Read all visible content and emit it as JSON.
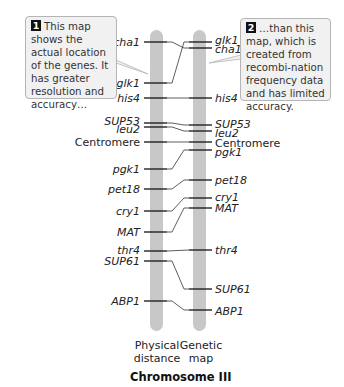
{
  "callouts": [
    {
      "number": "1",
      "text": "This map shows the actual location of the genes. It has greater resolution and accuracy…"
    },
    {
      "number": "2",
      "text": "…than this map, which is created from recombi-nation frequency data and has limited accuracy."
    }
  ],
  "maps": {
    "physical": {
      "label_line1": "Physical",
      "label_line2": "distance"
    },
    "genetic": {
      "label_line1": "Genetic",
      "label_line2": "map"
    }
  },
  "title": "Chromosome III",
  "colors": {
    "bar": "#c8c8c8",
    "callout_bg": "#f1f1f1",
    "callout_border": "#b5b5b5",
    "tick": "#111111"
  },
  "chart_data": {
    "type": "diagram",
    "title": "Chromosome III",
    "left_map": "Physical distance",
    "right_map": "Genetic map",
    "markers": [
      {
        "name": "cha1",
        "physical_y": 42,
        "genetic_y": 48
      },
      {
        "name": "glk1",
        "physical_y": 83,
        "genetic_y": 42
      },
      {
        "name": "his4",
        "physical_y": 98,
        "genetic_y": 98
      },
      {
        "name": "SUP53",
        "physical_y": 123,
        "genetic_y": 125
      },
      {
        "name": "leu2",
        "physical_y": 127,
        "genetic_y": 131
      },
      {
        "name": "Centromere",
        "physical_y": 142,
        "genetic_y": 142
      },
      {
        "name": "pgk1",
        "physical_y": 169,
        "genetic_y": 150
      },
      {
        "name": "pet18",
        "physical_y": 189,
        "genetic_y": 180
      },
      {
        "name": "cry1",
        "physical_y": 211,
        "genetic_y": 198
      },
      {
        "name": "MAT",
        "physical_y": 232,
        "genetic_y": 208
      },
      {
        "name": "thr4",
        "physical_y": 251,
        "genetic_y": 250
      },
      {
        "name": "SUP61",
        "physical_y": 261,
        "genetic_y": 289
      },
      {
        "name": "ABP1",
        "physical_y": 301,
        "genetic_y": 310
      }
    ]
  },
  "left_labels": [
    {
      "text": "cha1",
      "y": 42,
      "italic": true
    },
    {
      "text": "glk1",
      "y": 83,
      "italic": true
    },
    {
      "text": "his4",
      "y": 98,
      "italic": true
    },
    {
      "text": "SUP53",
      "y": 121,
      "italic": true
    },
    {
      "text": "leu2",
      "y": 129,
      "italic": true
    },
    {
      "text": "Centromere",
      "y": 142,
      "italic": false
    },
    {
      "text": "pgk1",
      "y": 169,
      "italic": true
    },
    {
      "text": "pet18",
      "y": 189,
      "italic": true
    },
    {
      "text": "cry1",
      "y": 211,
      "italic": true
    },
    {
      "text": "MAT",
      "y": 232,
      "italic": true
    },
    {
      "text": "thr4",
      "y": 250,
      "italic": true
    },
    {
      "text": "SUP61",
      "y": 261,
      "italic": true
    },
    {
      "text": "ABP1",
      "y": 301,
      "italic": true
    }
  ],
  "right_labels": [
    {
      "text": "glk1",
      "y": 40,
      "italic": true
    },
    {
      "text": "cha1",
      "y": 49,
      "italic": true
    },
    {
      "text": "his4",
      "y": 98,
      "italic": true
    },
    {
      "text": "SUP53",
      "y": 124,
      "italic": true
    },
    {
      "text": "leu2",
      "y": 133,
      "italic": true
    },
    {
      "text": "Centromere",
      "y": 143,
      "italic": false
    },
    {
      "text": "pgk1",
      "y": 152,
      "italic": true
    },
    {
      "text": "pet18",
      "y": 180,
      "italic": true
    },
    {
      "text": "cry1",
      "y": 197,
      "italic": true
    },
    {
      "text": "MAT",
      "y": 208,
      "italic": true
    },
    {
      "text": "thr4",
      "y": 250,
      "italic": true
    },
    {
      "text": "SUP61",
      "y": 289,
      "italic": true
    },
    {
      "text": "ABP1",
      "y": 311,
      "italic": true
    }
  ]
}
